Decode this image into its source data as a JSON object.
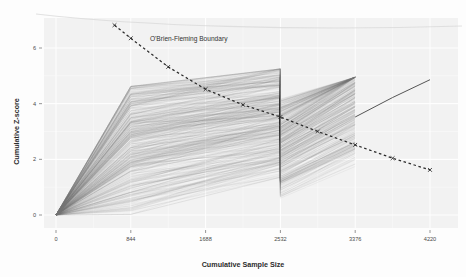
{
  "chart_data": {
    "type": "line",
    "title": "",
    "xlabel": "Cumulative Sample Size",
    "ylabel": "Cumulative Z-score",
    "xlim": [
      0,
      4220
    ],
    "ylim": [
      -0.35,
      6.9
    ],
    "xticks": [
      0,
      844,
      1688,
      2532,
      3376,
      4220
    ],
    "xticklabels": [
      "0",
      "844",
      "1688",
      "2532",
      "3376",
      "4220"
    ],
    "yticks": [
      0,
      2,
      4,
      6
    ],
    "yticklabels": [
      "0",
      "2",
      "4",
      "6"
    ],
    "grid": true,
    "grid_color": "#ffffff",
    "panel_color": "#f2f2f2",
    "legend_position": "none",
    "annotations": [
      {
        "text": "O'Brien-Fleming Boundary",
        "x": 1060,
        "y": 6.25
      }
    ],
    "series": [
      {
        "name": "O'Brien-Fleming Boundary",
        "style": "dashed",
        "color": "#2b2b2b",
        "marker": "x",
        "x": [
          660,
          844,
          1266,
          1688,
          2110,
          2532,
          2954,
          3376,
          3798,
          4220
        ],
        "values": [
          6.82,
          6.35,
          5.32,
          4.52,
          3.96,
          3.52,
          3.0,
          2.52,
          2.04,
          1.62
        ]
      },
      {
        "name": "Post-interim mean trajectory",
        "style": "solid",
        "color": "#555555",
        "marker": "none",
        "x": [
          3376,
          3798,
          4220
        ],
        "values": [
          3.52,
          4.22,
          4.86
        ]
      },
      {
        "name": "Simulated cumulative Z-score trajectories",
        "style": "spaghetti",
        "color": "#6f6f6f",
        "count": 400,
        "knots_x": [
          0,
          844,
          2532,
          2532,
          3376
        ],
        "knot_ranges": [
          [
            0.0,
            0.0
          ],
          [
            0.02,
            4.62
          ],
          [
            1.35,
            5.25
          ],
          [
            0.62,
            4.55
          ],
          [
            1.98,
            4.92
          ]
        ],
        "note": "Lines originate at (0,0), fan upward to interim analysis at 844, widen to 2532 where a sharp vertical drop occurs, then rise and terminate at 3376."
      }
    ]
  }
}
